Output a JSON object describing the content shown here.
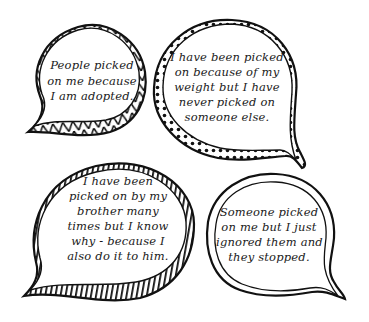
{
  "bubbles": [
    {
      "id": "adopted",
      "border_style": "triangles",
      "lines": [
        "People picked",
        "on me because",
        "I am adopted."
      ]
    },
    {
      "id": "weight",
      "border_style": "dots",
      "lines": [
        "I have been picked",
        "on because of my",
        "weight but I have",
        "never picked on",
        "someone else."
      ]
    },
    {
      "id": "brother",
      "border_style": "stripes",
      "lines": [
        "I have been",
        "picked on by my",
        "brother many",
        "times but I know",
        "why - because I",
        "also do it to him."
      ]
    },
    {
      "id": "ignored",
      "border_style": "plain",
      "lines": [
        "Someone picked",
        "on me but I just",
        "ignored them and",
        "they stopped."
      ]
    }
  ],
  "colors": {
    "ink": "#111111",
    "paper": "#ffffff"
  }
}
